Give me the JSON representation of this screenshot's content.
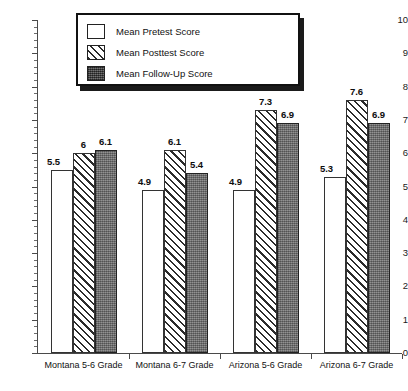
{
  "chart_data": {
    "type": "bar",
    "title": "",
    "xlabel": "",
    "ylabel": "",
    "ylim": [
      0,
      10
    ],
    "y_ticks": [
      0,
      1,
      2,
      3,
      4,
      5,
      6,
      7,
      8,
      9,
      10
    ],
    "y_tick_labels": [
      "0",
      "1",
      "2",
      "3",
      "4",
      "5",
      "6",
      "7",
      "8",
      "9",
      "10"
    ],
    "minor_ticks": true,
    "grid": false,
    "legend_position": "top-center",
    "categories": [
      "Montana 5-6 Grade",
      "Montana 6-7 Grade",
      "Arizona 5-6 Grade",
      "Arizona 6-7 Grade"
    ],
    "series": [
      {
        "name": "Mean Pretest Score",
        "fill": "white",
        "values": [
          5.5,
          4.9,
          4.9,
          5.3
        ],
        "labels": [
          "5.5",
          "4.9",
          "4.9",
          "5.3"
        ]
      },
      {
        "name": "Mean Posttest Score",
        "fill": "diagonal-hatch",
        "values": [
          6.0,
          6.1,
          7.3,
          7.6
        ],
        "labels": [
          "6",
          "6.1",
          "7.3",
          "7.6"
        ]
      },
      {
        "name": "Mean Follow-Up Score",
        "fill": "dark-gray-stipple",
        "values": [
          6.1,
          5.4,
          6.9,
          6.9
        ],
        "labels": [
          "6.1",
          "5.4",
          "6.9",
          "6.9"
        ]
      }
    ]
  },
  "legend": {
    "items": [
      {
        "label": "Mean Pretest Score",
        "swatch": "pretest"
      },
      {
        "label": "Mean Posttest Score",
        "swatch": "posttest"
      },
      {
        "label": "Mean Follow-Up Score",
        "swatch": "followup"
      }
    ]
  },
  "colors": {
    "axis": "#4a4a4a",
    "bar_outline": "#333333",
    "followup_fill": "#7c7c7c",
    "hatch": "#2b2b2b",
    "text": "#111111",
    "legend_shadow": "#1b1b1b"
  }
}
